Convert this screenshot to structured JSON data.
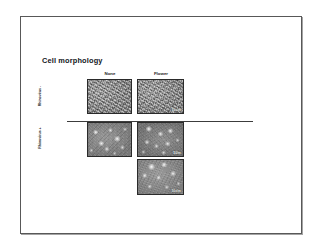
{
  "slide": {
    "title": "Cell morphology",
    "background_color": "#ffffff",
    "border_color": "#585858"
  },
  "figure": {
    "column_headers": [
      {
        "id": "none",
        "label": "None"
      },
      {
        "id": "flower",
        "label": "Flower"
      }
    ],
    "row_labels": [
      {
        "id": "rhinovirus-negative",
        "label": "Rhinovirus -"
      },
      {
        "id": "rhinovirus-positive",
        "label": "Rhinovirus +"
      }
    ],
    "panels": [
      {
        "id": "none-rhinovirus-negative",
        "column": "None",
        "row": "Rhinovirus -",
        "overlay": "",
        "texture": "fibrous-monolayer"
      },
      {
        "id": "flower-rhinovirus-negative",
        "column": "Flower",
        "row": "Rhinovirus -",
        "overlay": "10x/m",
        "texture": "fibrous-monolayer"
      },
      {
        "id": "none-rhinovirus-positive",
        "column": "None",
        "row": "Rhinovirus +",
        "overlay": "",
        "texture": "rounded-cpe"
      },
      {
        "id": "flower-rhinovirus-positive",
        "column": "Flower",
        "row": "Rhinovirus +",
        "overlay": "50/m",
        "texture": "rounded-cpe"
      },
      {
        "id": "flower-rhinovirus-positive-2",
        "column": "Flower",
        "row": "Rhinovirus +",
        "overlay": "10x/m",
        "texture": "rounded-cpe"
      }
    ]
  }
}
